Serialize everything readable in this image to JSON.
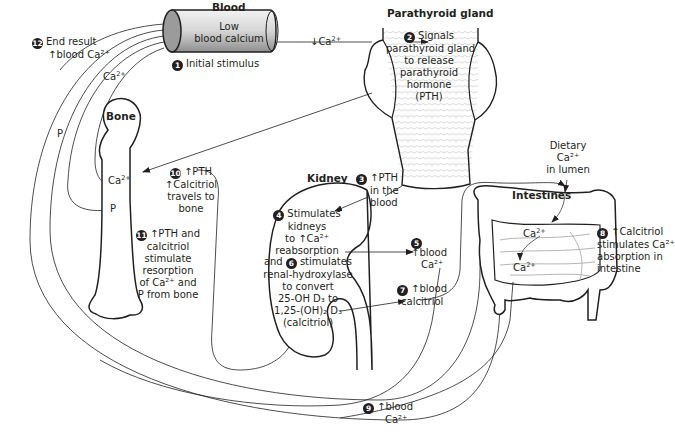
{
  "organs": {
    "blood": "Blood",
    "parathyroid": "Parathyroid gland",
    "bone": "Bone",
    "kidney": "Kidney",
    "intestines": "Intestines"
  },
  "blood_vessel_text": [
    "Low",
    "blood calcium"
  ],
  "steps": [
    {
      "n": "1",
      "text": "Initial stimulus"
    },
    {
      "n": "2",
      "lines": [
        "Signals",
        "parathyroid gland",
        "to release",
        "parathyroid",
        "hormone",
        "(PTH)"
      ]
    },
    {
      "n": "3",
      "lines": [
        "↑PTH",
        "in the",
        "blood"
      ]
    },
    {
      "n": "4",
      "lines": [
        "Stimulates",
        "kidneys",
        "to ↑Ca²⁺",
        "reabsorption"
      ]
    },
    {
      "n": "5",
      "lines": [
        "↑blood",
        "Ca²⁺"
      ]
    },
    {
      "n": "6",
      "lines": [
        "stimulates",
        "renal-hydroxylase",
        "to convert",
        "25-OH D₃ to",
        "1,25-(OH)₂ D₃",
        "(calcitriol)"
      ]
    },
    {
      "n": "7",
      "lines": [
        "↑blood",
        "calcitriol"
      ]
    },
    {
      "n": "8",
      "lines": [
        "↑Calcitriol",
        "stimulates Ca²⁺",
        "absorption in",
        "intestine"
      ]
    },
    {
      "n": "9",
      "lines": [
        "↑blood",
        "Ca²⁺"
      ]
    },
    {
      "n": "10",
      "lines": [
        "↑PTH",
        "↑Calcitriol",
        "travels to",
        "bone"
      ]
    },
    {
      "n": "11",
      "lines": [
        "↑PTH and",
        "calcitriol",
        "stimulate",
        "resorption",
        "of Ca²⁺ and",
        "P from bone"
      ]
    },
    {
      "n": "12",
      "lines": [
        "End result",
        "↑blood Ca²⁺"
      ]
    }
  ],
  "and_word": "and",
  "ca_labels": {
    "low_ca_arrow": "↓Ca",
    "ca": "Ca",
    "p": "P",
    "charge": "2+"
  },
  "dietary": [
    "Dietary",
    "Ca²⁺",
    "in lumen"
  ]
}
